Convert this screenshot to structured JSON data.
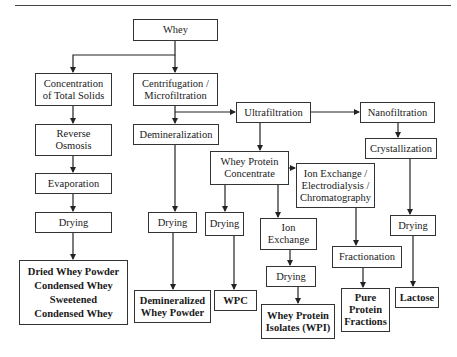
{
  "diagram": {
    "nodes": {
      "whey": "Whey",
      "concentration": "Concentration\nof Total Solids",
      "centrifugation": "Centrifugation /\nMicrofiltration",
      "ultrafiltration": "Ultrafiltration",
      "nanofiltration": "Nanofiltration",
      "demineralization": "Demineralization",
      "reverse_osmosis": "Reverse\nOsmosis",
      "wpc_process": "Whey Protein\nConcentrate",
      "crystallization": "Crystallization",
      "ion_electro_chrom": "Ion Exchange /\nElectrodialysis /\nChromatography",
      "evaporation": "Evaporation",
      "drying_1": "Drying",
      "drying_demin": "Drying",
      "drying_wpc": "Drying",
      "ion_exchange": "Ion\nExchange",
      "drying_lactose": "Drying",
      "fractionation": "Fractionation",
      "drying_ion": "Drying",
      "out_dried_whey": "Dried Whey Powder\nCondensed Whey\nSweetened\nCondensed Whey",
      "out_demin_powder": "Demineralized\nWhey Powder",
      "out_wpc": "WPC",
      "out_wpi": "Whey Protein\nIsolates (WPI)",
      "out_pure_protein": "Pure\nProtein\nFractions",
      "out_lactose": "Lactose"
    },
    "edges": [
      [
        "whey",
        "concentration"
      ],
      [
        "whey",
        "centrifugation"
      ],
      [
        "centrifugation",
        "demineralization"
      ],
      [
        "centrifugation",
        "ultrafiltration"
      ],
      [
        "ultrafiltration",
        "nanofiltration"
      ],
      [
        "ultrafiltration",
        "wpc_process"
      ],
      [
        "nanofiltration",
        "crystallization"
      ],
      [
        "crystallization",
        "drying_lactose"
      ],
      [
        "drying_lactose",
        "out_lactose"
      ],
      [
        "wpc_process",
        "ion_electro_chrom"
      ],
      [
        "wpc_process",
        "drying_wpc"
      ],
      [
        "wpc_process",
        "ion_exchange"
      ],
      [
        "ion_electro_chrom",
        "fractionation"
      ],
      [
        "fractionation",
        "out_pure_protein"
      ],
      [
        "ion_exchange",
        "drying_ion"
      ],
      [
        "drying_ion",
        "out_wpi"
      ],
      [
        "drying_wpc",
        "out_wpc"
      ],
      [
        "demineralization",
        "drying_demin"
      ],
      [
        "drying_demin",
        "out_demin_powder"
      ],
      [
        "concentration",
        "reverse_osmosis"
      ],
      [
        "reverse_osmosis",
        "evaporation"
      ],
      [
        "evaporation",
        "drying_1"
      ],
      [
        "drying_1",
        "out_dried_whey"
      ]
    ]
  }
}
